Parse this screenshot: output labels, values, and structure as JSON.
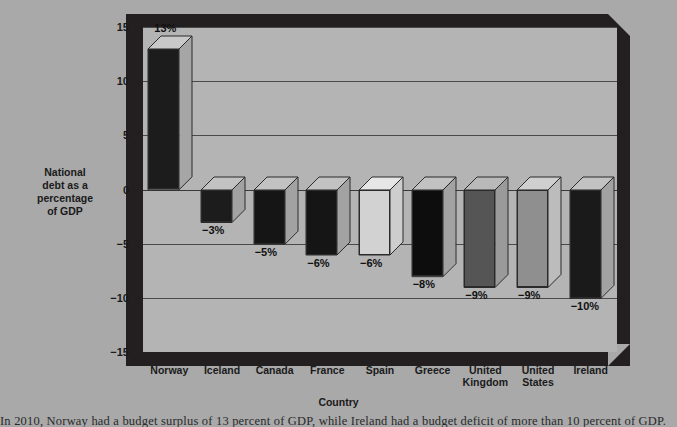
{
  "chart_data": {
    "type": "bar",
    "title": "",
    "xlabel": "Country",
    "ylabel": "National debt as a percentage of GDP",
    "ylim": [
      -15,
      15
    ],
    "yticks": [
      "15",
      "10",
      "5",
      "0",
      "−5",
      "−10",
      "−15"
    ],
    "grid": true,
    "legend": "none",
    "categories": [
      "Norway",
      "Iceland",
      "Canada",
      "France",
      "Spain",
      "Greece",
      "United Kingdom",
      "United States",
      "Ireland"
    ],
    "values": [
      13,
      -3,
      -5,
      -6,
      -6,
      -8,
      -9,
      -9,
      -10
    ],
    "data_labels": [
      "13%",
      "−3%",
      "−5%",
      "−6%",
      "−6%",
      "−8%",
      "−9%",
      "−9%",
      "−10%"
    ],
    "bar_colors": [
      "#1c1c1c",
      "#1c1c1c",
      "#151515",
      "#151515",
      "#d2d2d2",
      "#0d0d0d",
      "#555555",
      "#8f8f8f",
      "#1a1a1a"
    ],
    "bar_top_colors": [
      "#c9c9c9",
      "#c2c2c2",
      "#c2c2c2",
      "#c2c2c2",
      "#e6e6e6",
      "#c2c2c2",
      "#b9b9b9",
      "#cfcfcf",
      "#c2c2c2"
    ],
    "bar_side_colors": [
      "#a6a6a6",
      "#a2a2a2",
      "#a2a2a2",
      "#a2a2a2",
      "#cdcdcd",
      "#a2a2a2",
      "#9a9a9a",
      "#bcbcbc",
      "#a2a2a2"
    ]
  },
  "xtick_lines": [
    [
      "Norway"
    ],
    [
      "Iceland"
    ],
    [
      "Canada"
    ],
    [
      "France"
    ],
    [
      "Spain"
    ],
    [
      "Greece"
    ],
    [
      "United",
      "Kingdom"
    ],
    [
      "United",
      "States"
    ],
    [
      "Ireland"
    ]
  ],
  "axis": {
    "y_title_lines": [
      "National",
      "debt as a",
      "percentage",
      "of  GDP"
    ],
    "x_title": "Country"
  },
  "colors": {
    "page_background": "#a9a9a9",
    "plot_background": "#b5b5b5",
    "frame": "#231f20",
    "gridline": "#4a4a4a",
    "text": "#1a1a1a"
  },
  "body_text": "In 2010, Norway had a budget surplus of 13 percent of GDP, while Ireland had a budget deficit of more than 10 percent of GDP."
}
